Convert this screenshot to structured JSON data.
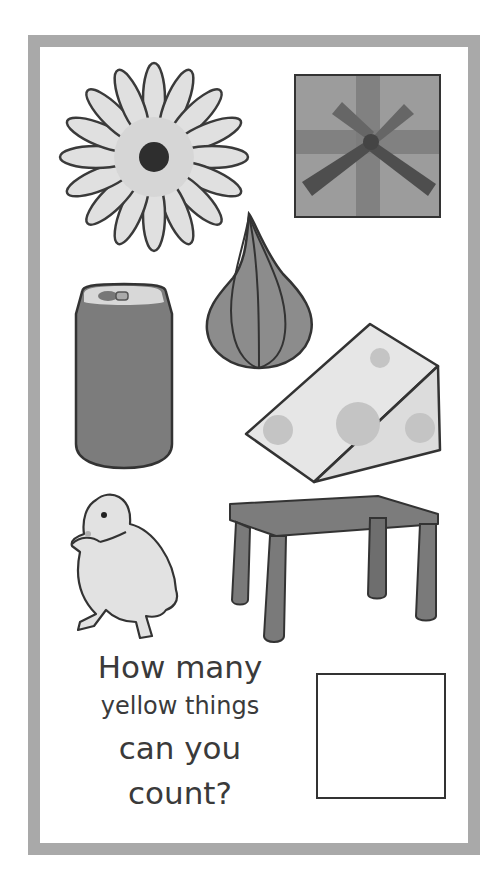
{
  "worksheet": {
    "border_color": "#a9a9a9",
    "question": {
      "line1": "How many",
      "line2": "yellow things",
      "line3": "can you",
      "line4": "count?"
    },
    "answer_box": {
      "value": ""
    }
  },
  "pictures": [
    {
      "name": "flower",
      "icon": "daisy-flower-icon"
    },
    {
      "name": "gift box",
      "icon": "gift-box-icon"
    },
    {
      "name": "onion",
      "icon": "onion-icon"
    },
    {
      "name": "soda can",
      "icon": "soda-can-icon"
    },
    {
      "name": "cheese",
      "icon": "cheese-wedge-icon"
    },
    {
      "name": "duckling",
      "icon": "duckling-icon"
    },
    {
      "name": "table",
      "icon": "table-icon"
    }
  ],
  "colors": {
    "outline": "#3a3a3a",
    "flower_petal": "#dedede",
    "flower_center": "#2e2e2e",
    "gift": "#9a9a9a",
    "ribbon": "#6e6e6e",
    "bow": "#4e4e4e",
    "onion": "#8a8a8a",
    "can": "#7c7c7c",
    "cheese": "#e4e4e4",
    "cheese_hole": "#c4c4c4",
    "duck": "#e2e2e2",
    "table": "#7a7a7a"
  }
}
